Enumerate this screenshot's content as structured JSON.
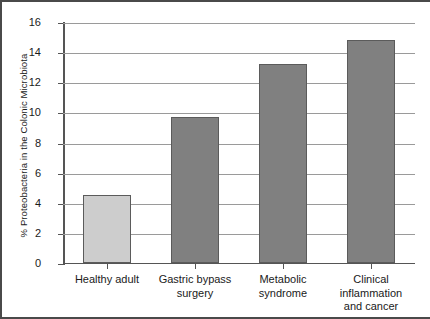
{
  "chart_data": {
    "type": "bar",
    "title": "",
    "xlabel": "",
    "ylabel": "% Proteobacteria in the Colonic Microbiota",
    "categories": [
      "Healthy adult",
      "Gastric bypass surgery",
      "Metabolic syndrome",
      "Clinical inflammation and cancer"
    ],
    "category_lines": [
      [
        "Healthy adult"
      ],
      [
        "Gastric bypass",
        "surgery"
      ],
      [
        "Metabolic syndrome"
      ],
      [
        "Clinical",
        "inflammation",
        "and cancer"
      ]
    ],
    "values": [
      4.5,
      9.7,
      13.2,
      14.8
    ],
    "ylim": [
      0,
      16
    ],
    "ytick_labels": [
      "0",
      "2",
      "4",
      "6",
      "8",
      "10",
      "12",
      "14",
      "16"
    ],
    "ytick_values": [
      0,
      2,
      4,
      6,
      8,
      10,
      12,
      14,
      16
    ],
    "grid": true,
    "legend": "none",
    "bar_colors": [
      "#cdcdcd",
      "#808080",
      "#808080",
      "#808080"
    ],
    "bar_edge_color": "#5b5b5b",
    "grid_color": "#9a9a9a",
    "axis_color": "#555555",
    "text_color": "#1a1a1a",
    "background_color": "#ffffff"
  }
}
